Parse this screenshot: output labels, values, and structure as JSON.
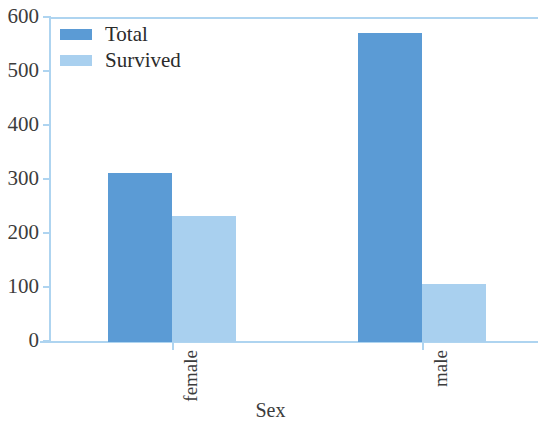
{
  "chart_data": {
    "type": "bar",
    "title": "",
    "subtitle": "",
    "xlabel": "Sex",
    "ylabel": "",
    "categories": [
      "female",
      "male"
    ],
    "series": [
      {
        "name": "Total",
        "values": [
          313,
          573
        ],
        "color": "#5b9bd5"
      },
      {
        "name": "Survived",
        "values": [
          233,
          107
        ],
        "color": "#a9d0ef"
      }
    ],
    "ylim": [
      0,
      600
    ],
    "yticks": [
      0,
      100,
      200,
      300,
      400,
      500,
      600
    ],
    "ytick_labels": [
      "0",
      "100",
      "200",
      "300",
      "400",
      "500",
      "600"
    ],
    "grid": false,
    "legend_position": "upper-left",
    "axis_color": "#aed4f0",
    "background": "#ffffff",
    "xtick_rotation": 90
  },
  "axes": {
    "y_labels": [
      "600",
      "500",
      "400",
      "300",
      "200",
      "100",
      "0"
    ],
    "x_labels": [
      "female",
      "male"
    ],
    "x_title": "Sex"
  },
  "legend": {
    "items": [
      {
        "label": "Total",
        "color": "#5b9bd5"
      },
      {
        "label": "Survived",
        "color": "#a9d0ef"
      }
    ]
  }
}
